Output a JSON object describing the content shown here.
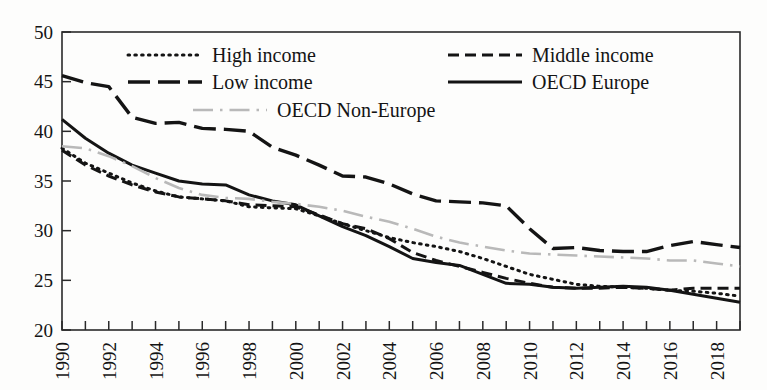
{
  "chart_data": {
    "type": "line",
    "title": "",
    "subtitle": "",
    "xlabel": "",
    "ylabel": "",
    "xlim": [
      1990,
      2019
    ],
    "ylim": [
      20,
      50
    ],
    "ytick_values": [
      20,
      25,
      30,
      35,
      40,
      45,
      50
    ],
    "ytick_labels": [
      "20",
      "25",
      "30",
      "35",
      "40",
      "45",
      "50"
    ],
    "xtick_values": [
      1990,
      1992,
      1994,
      1996,
      1998,
      2000,
      2002,
      2004,
      2006,
      2008,
      2010,
      2012,
      2014,
      2016,
      2018
    ],
    "xtick_labels": [
      "1990",
      "1992",
      "1994",
      "1996",
      "1998",
      "2000",
      "2002",
      "2004",
      "2006",
      "2008",
      "2010",
      "2012",
      "2014",
      "2016",
      "2018"
    ],
    "xtick_minor_values": [
      1991,
      1993,
      1995,
      1997,
      1999,
      2001,
      2003,
      2005,
      2007,
      2009,
      2011,
      2013,
      2015,
      2017,
      2019
    ],
    "grid": false,
    "legend_position": "inside-top",
    "x": [
      1990,
      1991,
      1992,
      1993,
      1994,
      1995,
      1996,
      1997,
      1998,
      1999,
      2000,
      2001,
      2002,
      2003,
      2004,
      2005,
      2006,
      2007,
      2008,
      2009,
      2010,
      2011,
      2012,
      2013,
      2014,
      2015,
      2016,
      2017,
      2018,
      2019
    ],
    "series": [
      {
        "name": "High income",
        "style": "dotted",
        "color": "#141414",
        "values": [
          38.3,
          36.8,
          35.8,
          34.8,
          34.0,
          33.4,
          33.2,
          33.0,
          32.4,
          32.3,
          32.2,
          31.5,
          30.7,
          30.0,
          29.3,
          28.8,
          28.4,
          27.9,
          27.2,
          26.4,
          25.6,
          25.1,
          24.6,
          24.4,
          24.3,
          24.2,
          24.0,
          23.9,
          23.7,
          23.4
        ]
      },
      {
        "name": "Middle income",
        "style": "dashed",
        "color": "#141414",
        "values": [
          38.1,
          36.6,
          35.5,
          34.6,
          33.9,
          33.4,
          33.2,
          33.0,
          32.6,
          32.5,
          32.4,
          31.6,
          30.7,
          30.2,
          29.2,
          27.8,
          27.0,
          26.4,
          25.8,
          25.2,
          24.7,
          24.3,
          24.2,
          24.2,
          24.3,
          24.2,
          24.0,
          24.2,
          24.2,
          24.2
        ]
      },
      {
        "name": "Low income",
        "style": "long-dash",
        "color": "#141414",
        "values": [
          45.6,
          44.9,
          44.5,
          41.4,
          40.8,
          40.9,
          40.3,
          40.2,
          40.0,
          38.4,
          37.6,
          36.6,
          35.5,
          35.4,
          34.7,
          33.7,
          33.0,
          32.9,
          32.8,
          32.5,
          30.2,
          28.2,
          28.3,
          28.0,
          27.9,
          27.9,
          28.5,
          28.9,
          28.6,
          28.3
        ]
      },
      {
        "name": "OECD Europe",
        "style": "solid",
        "color": "#141414",
        "values": [
          41.2,
          39.3,
          37.8,
          36.6,
          35.8,
          35.0,
          34.7,
          34.6,
          33.6,
          33.0,
          32.6,
          31.5,
          30.4,
          29.5,
          28.4,
          27.2,
          26.8,
          26.5,
          25.6,
          24.7,
          24.6,
          24.3,
          24.2,
          24.3,
          24.4,
          24.3,
          24.0,
          23.6,
          23.2,
          22.8
        ]
      },
      {
        "name": "OECD Non-Europe",
        "style": "dash-dot-light",
        "color": "#b9b9b9",
        "values": [
          38.5,
          38.3,
          37.5,
          36.5,
          35.3,
          34.3,
          33.6,
          33.3,
          33.2,
          32.9,
          32.7,
          32.4,
          32.0,
          31.4,
          30.9,
          30.2,
          29.4,
          28.8,
          28.4,
          28.0,
          27.7,
          27.6,
          27.5,
          27.4,
          27.3,
          27.2,
          27.0,
          27.0,
          26.7,
          26.4
        ]
      }
    ],
    "legend": [
      {
        "label": "High income",
        "style": "dotted",
        "color": "#141414"
      },
      {
        "label": "Middle income",
        "style": "dashed",
        "color": "#141414"
      },
      {
        "label": "Low income",
        "style": "long-dash",
        "color": "#141414"
      },
      {
        "label": "OECD Europe",
        "style": "solid",
        "color": "#141414"
      },
      {
        "label": "OECD Non-Europe",
        "style": "dash-dot-light",
        "color": "#b9b9b9"
      }
    ]
  },
  "axes": {
    "frame_color": "#2a2a2a"
  }
}
